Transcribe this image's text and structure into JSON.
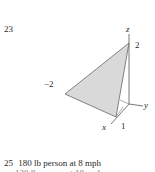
{
  "problem_number": "23",
  "figure": {
    "type": "3d-plane-triangle",
    "axes": {
      "z_label": "z",
      "y_label": "y",
      "x_label": "x"
    },
    "intercepts": {
      "z": "2",
      "y": "−2",
      "x": "1"
    },
    "fill_color": "#d9d9d9",
    "stroke_color": "#555555"
  },
  "next_item": {
    "number": "25",
    "text": "180 lb person at 8 mph",
    "cut_off_line": "120 lb person at 10 mph"
  }
}
